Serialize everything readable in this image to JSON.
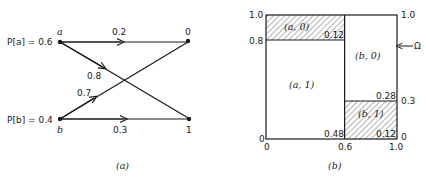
{
  "panel_a": {
    "caption": "(a)",
    "inputs": [
      {
        "symbol": "a",
        "prob_label": "P[a] = 0.6"
      },
      {
        "symbol": "b",
        "prob_label": "P[b] = 0.4"
      }
    ],
    "outputs": [
      {
        "symbol": "0"
      },
      {
        "symbol": "1"
      }
    ],
    "edges": [
      {
        "from": "a",
        "to": "0",
        "label": "0.2"
      },
      {
        "from": "a",
        "to": "1",
        "label": "0.8"
      },
      {
        "from": "b",
        "to": "0",
        "label": "0.7"
      },
      {
        "from": "b",
        "to": "1",
        "label": "0.3"
      }
    ]
  },
  "panel_b": {
    "caption": "(b)",
    "omega_label": "Ω",
    "x_ticks": [
      "0",
      "0.6",
      "1.0"
    ],
    "left_y_ticks": [
      "0",
      "0.8",
      "1.0"
    ],
    "right_y_ticks": [
      "0",
      "0.3",
      "1.0"
    ],
    "regions": [
      {
        "name": "(a, 0)",
        "area": "0.12",
        "hatched": true
      },
      {
        "name": "(a, 1)",
        "area": "0.48",
        "hatched": false
      },
      {
        "name": "(b, 0)",
        "area": "0.28",
        "hatched": false
      },
      {
        "name": "(b, 1)",
        "area": "0.12",
        "hatched": true
      }
    ]
  }
}
